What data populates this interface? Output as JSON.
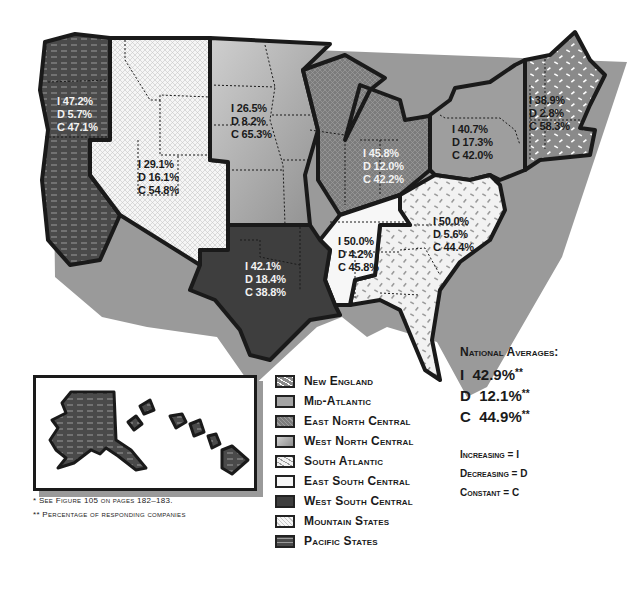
{
  "map": {
    "regions": [
      {
        "id": "pacific",
        "name": "Pacific States",
        "I": "47.2%",
        "D": "5.7%",
        "C": "47.1%",
        "fill": "#4a4a4a",
        "pattern": "dashes"
      },
      {
        "id": "mountain",
        "name": "Mountain States",
        "I": "29.1%",
        "D": "16.1%",
        "C": "54.8%",
        "fill": "#f4f4f4",
        "pattern": "crosshatch"
      },
      {
        "id": "west_north_central",
        "name": "West North Central",
        "I": "26.5%",
        "D": "8.2%",
        "C": "65.3%",
        "fill": "#a8a8a8",
        "pattern": "gradient"
      },
      {
        "id": "east_north_central",
        "name": "East North Central",
        "I": "45.8%",
        "D": "12.0%",
        "C": "42.2%",
        "fill": "#7a7a7a",
        "pattern": "crosshatch-dark"
      },
      {
        "id": "mid_atlantic",
        "name": "Mid-Atlantic",
        "I": "40.7%",
        "D": "17.3%",
        "C": "42.0%",
        "fill": "#9e9e9e",
        "pattern": "solid"
      },
      {
        "id": "new_england",
        "name": "New England",
        "I": "38.9%",
        "D": "2.8%",
        "C": "58.3%",
        "fill": "#8a8a8a",
        "pattern": "white-speckles"
      },
      {
        "id": "south_atlantic",
        "name": "South Atlantic",
        "I": "50.0%",
        "D": "5.6%",
        "C": "44.4%",
        "fill": "#f2f2f2",
        "pattern": "gray-speckles"
      },
      {
        "id": "east_south_central",
        "name": "East South Central",
        "I": "50.0%",
        "D": "4.2%",
        "C": "45.8%",
        "fill": "#f7f7f7",
        "pattern": "solid"
      },
      {
        "id": "west_south_central",
        "name": "West South Central",
        "I": "42.1%",
        "D": "18.4%",
        "C": "38.8%",
        "fill": "#3e3e3e",
        "pattern": "solid"
      }
    ],
    "prefix": {
      "I": "I ",
      "D": "D ",
      "C": "C "
    }
  },
  "legend": {
    "items": [
      {
        "label": "New England"
      },
      {
        "label": "Mid-Atlantic"
      },
      {
        "label": "East North Central"
      },
      {
        "label": "West North Central"
      },
      {
        "label": "South Atlantic"
      },
      {
        "label": "East South Central"
      },
      {
        "label": "West South Central"
      },
      {
        "label": "Mountain States"
      },
      {
        "label": "Pacific States"
      }
    ]
  },
  "national": {
    "title": "National Averages:",
    "rows": [
      {
        "key": "I",
        "value": "42.9%",
        "mark": "**"
      },
      {
        "key": "D",
        "value": "12.1%",
        "mark": "**"
      },
      {
        "key": "C",
        "value": "44.9%",
        "mark": "**"
      }
    ]
  },
  "key": {
    "rows": [
      "Increasing = I",
      "Decreasing = D",
      "Constant = C"
    ]
  },
  "footnotes": [
    "* See Figure 105 on pages 182–183.",
    "** Percentage of responding companies"
  ],
  "colors": {
    "outline": "#1a1a1a",
    "shadow": "#9a9a9a"
  }
}
